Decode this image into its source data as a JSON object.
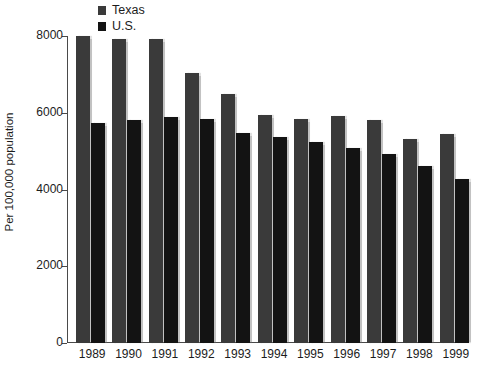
{
  "chart_data": {
    "type": "bar",
    "title": "",
    "xlabel": "",
    "ylabel": "Per 100,000 population",
    "categories": [
      "1989",
      "1990",
      "1991",
      "1992",
      "1993",
      "1994",
      "1995",
      "1996",
      "1997",
      "1998",
      "1999"
    ],
    "series": [
      {
        "name": "Texas",
        "color": "#3a3a3a",
        "values": [
          8000,
          7920,
          7910,
          7030,
          6480,
          5940,
          5840,
          5910,
          5800,
          5320,
          5450
        ]
      },
      {
        "name": "U.S.",
        "color": "#131313",
        "values": [
          5740,
          5820,
          5900,
          5830,
          5480,
          5370,
          5250,
          5080,
          4930,
          4620,
          4270
        ]
      }
    ],
    "ylim": [
      0,
      8000
    ],
    "yticks": [
      0,
      2000,
      4000,
      6000,
      8000
    ],
    "ytick_labels": [
      "0",
      "2000",
      "4000",
      "6000",
      "8000"
    ],
    "grid": false,
    "legend_position": "top-left"
  },
  "legend": {
    "items": [
      {
        "label": "Texas",
        "color": "#3a3a3a"
      },
      {
        "label": "U.S.",
        "color": "#131313"
      }
    ]
  },
  "axes": {
    "y_axis_title": "Per 100,000 population"
  },
  "colors": {
    "texas": "#3a3a3a",
    "us": "#131313",
    "axis": "#4a4a4a",
    "text": "#1c1c1c",
    "background": "#ffffff"
  }
}
